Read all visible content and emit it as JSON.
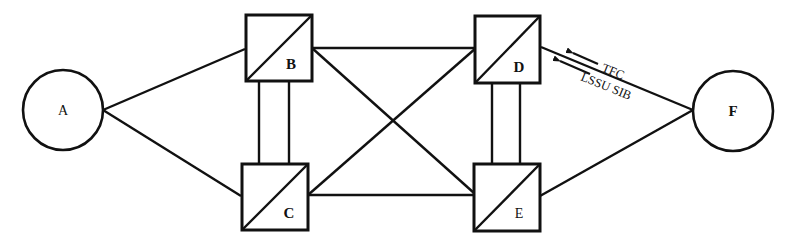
{
  "diagram": {
    "type": "signaling network topology",
    "nodes": [
      {
        "id": "A",
        "label": "A",
        "shape": "circle",
        "role": "signaling point"
      },
      {
        "id": "B",
        "label": "B",
        "shape": "box-with-diagonal",
        "role": "signal transfer point"
      },
      {
        "id": "C",
        "label": "C",
        "shape": "box-with-diagonal",
        "role": "signal transfer point"
      },
      {
        "id": "D",
        "label": "D",
        "shape": "box-with-diagonal",
        "role": "signal transfer point"
      },
      {
        "id": "E",
        "label": "E",
        "shape": "box-with-diagonal",
        "role": "signal transfer point"
      },
      {
        "id": "F",
        "label": "F",
        "shape": "circle",
        "role": "signaling point"
      }
    ],
    "links": [
      {
        "from": "A",
        "to": "B"
      },
      {
        "from": "A",
        "to": "C"
      },
      {
        "from": "B",
        "to": "C",
        "style": "double"
      },
      {
        "from": "B",
        "to": "D"
      },
      {
        "from": "B",
        "to": "E"
      },
      {
        "from": "C",
        "to": "D"
      },
      {
        "from": "C",
        "to": "E"
      },
      {
        "from": "D",
        "to": "E",
        "style": "double"
      },
      {
        "from": "D",
        "to": "F"
      },
      {
        "from": "E",
        "to": "F"
      }
    ],
    "annotations": [
      {
        "text": "TFC",
        "on_link": "D-F",
        "arrow_direction": "toward D"
      },
      {
        "text": "LSSU SIB",
        "on_link": "D-F",
        "arrow_direction": "toward D"
      }
    ],
    "colors": {
      "line": "#111111",
      "background": "#ffffff"
    }
  }
}
